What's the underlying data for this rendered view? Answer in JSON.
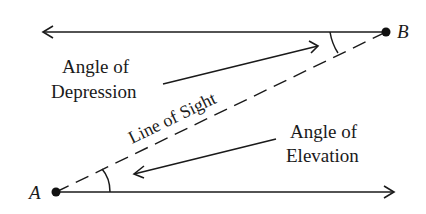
{
  "diagram": {
    "points": {
      "A": {
        "label": "A"
      },
      "B": {
        "label": "B"
      }
    },
    "labels": {
      "depression_line1": "Angle of",
      "depression_line2": "Depression",
      "elevation_line1": "Angle of",
      "elevation_line2": "Elevation",
      "line_of_sight": "Line of Sight"
    },
    "colors": {
      "ink": "#1a1a1a",
      "background": "#ffffff"
    }
  }
}
